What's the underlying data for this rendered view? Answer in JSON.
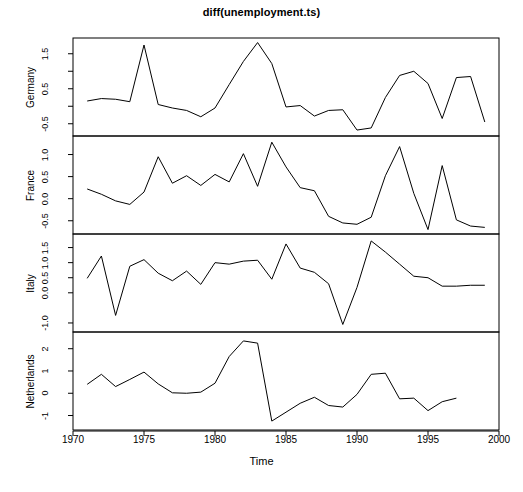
{
  "chart_data": {
    "type": "line",
    "title": "diff(unemployment.ts)",
    "xlabel": "Time",
    "ylabel": "",
    "grid": false,
    "legend": "none",
    "multi_panel": true,
    "panel_layout": "4 stacked panels sharing one x-axis",
    "xlim": [
      1970,
      2000
    ],
    "xticks": [
      1970,
      1975,
      1980,
      1985,
      1990,
      1995,
      2000
    ],
    "xticklabels": [
      "1970",
      "1975",
      "1980",
      "1985",
      "1990",
      "1995",
      "2000"
    ],
    "x": [
      1971,
      1972,
      1973,
      1974,
      1975,
      1976,
      1977,
      1978,
      1979,
      1980,
      1981,
      1982,
      1983,
      1984,
      1985,
      1986,
      1987,
      1988,
      1989,
      1990,
      1991,
      1992,
      1993,
      1994,
      1995,
      1996,
      1997,
      1998,
      1999
    ],
    "panels": [
      {
        "name": "Germany",
        "ylabel": "Germany",
        "ylim": [
          -0.85,
          1.95
        ],
        "yticks": [
          -0.5,
          0.5,
          1.5
        ],
        "yticklabels": [
          "-0.5",
          "0.5",
          "1.5"
        ],
        "minor_yticks": [
          -1.0,
          0.0,
          1.0
        ],
        "values": [
          0.15,
          0.22,
          0.2,
          0.13,
          1.75,
          0.05,
          -0.05,
          -0.12,
          -0.3,
          -0.05,
          0.62,
          1.28,
          1.82,
          1.22,
          -0.02,
          0.02,
          -0.28,
          -0.12,
          -0.1,
          -0.68,
          -0.62,
          0.25,
          0.88,
          1.0,
          0.65,
          -0.35,
          0.82,
          0.85,
          -0.45
        ]
      },
      {
        "name": "France",
        "ylabel": "France",
        "ylim": [
          -0.8,
          1.42
        ],
        "yticks": [
          -0.5,
          0.0,
          0.5,
          1.0
        ],
        "yticklabels": [
          "-0.5",
          "0.0",
          "0.5",
          "1.0"
        ],
        "minor_yticks": [],
        "values": [
          0.22,
          0.1,
          -0.05,
          -0.13,
          0.15,
          0.95,
          0.35,
          0.52,
          0.3,
          0.55,
          0.38,
          1.02,
          0.28,
          1.28,
          0.72,
          0.25,
          0.18,
          -0.4,
          -0.55,
          -0.58,
          -0.42,
          0.52,
          1.18,
          0.12,
          -0.7,
          0.75,
          -0.48,
          -0.62,
          -0.65
        ]
      },
      {
        "name": "Italy",
        "ylabel": "Italy",
        "ylim": [
          -1.3,
          1.95
        ],
        "yticks": [
          -1.0,
          0.0,
          0.5,
          1.0,
          1.5
        ],
        "yticklabels": [
          "-1.0",
          "0.0",
          "0.5",
          "1.0",
          "1.5"
        ],
        "minor_yticks": [],
        "values": [
          0.48,
          1.22,
          -0.75,
          0.88,
          1.1,
          0.65,
          0.4,
          0.72,
          0.28,
          1.0,
          0.95,
          1.05,
          1.08,
          0.45,
          1.62,
          0.82,
          0.68,
          0.3,
          -1.05,
          0.18,
          1.72,
          1.35,
          0.95,
          0.55,
          0.5,
          0.22,
          0.22,
          0.25,
          0.25
        ]
      },
      {
        "name": "Netherlands",
        "ylabel": "Netherlands",
        "ylim": [
          -1.65,
          2.75
        ],
        "yticks": [
          -1,
          0,
          1,
          2
        ],
        "yticklabels": [
          "-1",
          "0",
          "1",
          "2"
        ],
        "minor_yticks": [],
        "values": [
          0.4,
          0.85,
          0.3,
          0.62,
          0.95,
          0.42,
          0.02,
          0.0,
          0.05,
          0.45,
          1.65,
          2.35,
          2.25,
          -1.25,
          -0.85,
          -0.45,
          -0.18,
          -0.55,
          -0.62,
          -0.05,
          0.85,
          0.9,
          -0.25,
          -0.22,
          -0.78,
          -0.38,
          -0.22
        ]
      }
    ]
  },
  "figure": {
    "title": "diff(unemployment.ts)",
    "xlabel": "Time"
  }
}
